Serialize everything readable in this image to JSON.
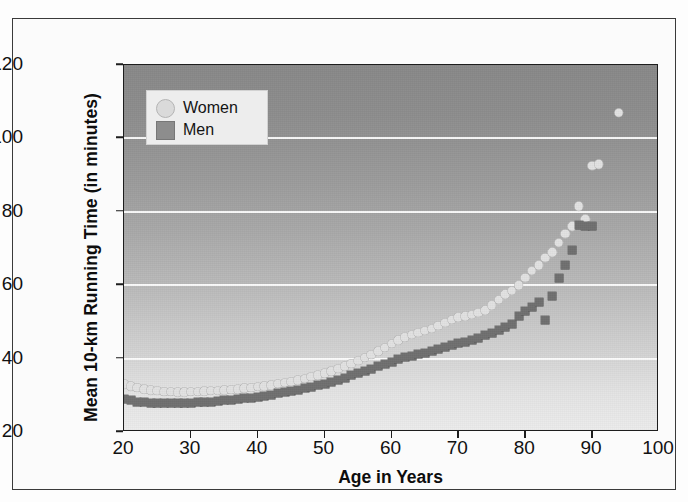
{
  "chart_data": {
    "type": "scatter",
    "title": "",
    "xlabel": "Age in Years",
    "ylabel": "Mean 10-km Running Time (in minutes)",
    "xlim": [
      20,
      100
    ],
    "ylim": [
      20,
      120
    ],
    "xticks": [
      20,
      30,
      40,
      50,
      60,
      70,
      80,
      90,
      100
    ],
    "yticks": [
      20,
      40,
      60,
      80,
      100,
      120
    ],
    "grid": "horizontal-white-gridlines-at-40-60-80-100",
    "legend_position": "top-left-inside-plot",
    "background": "vertical gray gradient, dark at top, light at bottom",
    "series": [
      {
        "name": "Women",
        "marker": "circle",
        "color": "#e2e2e2",
        "points": [
          [
            20,
            33.0
          ],
          [
            21,
            32.4
          ],
          [
            22,
            32.0
          ],
          [
            23,
            31.6
          ],
          [
            24,
            31.4
          ],
          [
            25,
            31.2
          ],
          [
            26,
            31.0
          ],
          [
            27,
            30.9
          ],
          [
            28,
            30.8
          ],
          [
            29,
            30.8
          ],
          [
            30,
            30.9
          ],
          [
            31,
            31.0
          ],
          [
            32,
            31.1
          ],
          [
            33,
            31.2
          ],
          [
            34,
            31.3
          ],
          [
            35,
            31.4
          ],
          [
            36,
            31.5
          ],
          [
            37,
            31.7
          ],
          [
            38,
            31.9
          ],
          [
            39,
            32.1
          ],
          [
            40,
            32.3
          ],
          [
            41,
            32.5
          ],
          [
            42,
            32.8
          ],
          [
            43,
            33.1
          ],
          [
            44,
            33.4
          ],
          [
            45,
            33.7
          ],
          [
            46,
            34.1
          ],
          [
            47,
            34.5
          ],
          [
            48,
            35.0
          ],
          [
            49,
            35.5
          ],
          [
            50,
            36.0
          ],
          [
            51,
            36.6
          ],
          [
            52,
            37.2
          ],
          [
            53,
            37.9
          ],
          [
            54,
            38.6
          ],
          [
            55,
            39.4
          ],
          [
            56,
            40.2
          ],
          [
            57,
            41.1
          ],
          [
            58,
            42.0
          ],
          [
            59,
            43.0
          ],
          [
            60,
            44.0
          ],
          [
            61,
            45.0
          ],
          [
            62,
            45.8
          ],
          [
            63,
            46.5
          ],
          [
            64,
            47.0
          ],
          [
            65,
            47.6
          ],
          [
            66,
            48.2
          ],
          [
            67,
            49.0
          ],
          [
            68,
            49.8
          ],
          [
            69,
            50.6
          ],
          [
            70,
            51.2
          ],
          [
            71,
            51.6
          ],
          [
            72,
            52.0
          ],
          [
            73,
            52.5
          ],
          [
            74,
            53.2
          ],
          [
            75,
            54.5
          ],
          [
            76,
            56.0
          ],
          [
            77,
            57.5
          ],
          [
            78,
            58.5
          ],
          [
            79,
            60.0
          ],
          [
            80,
            62.0
          ],
          [
            81,
            64.0
          ],
          [
            82,
            65.5
          ],
          [
            83,
            67.5
          ],
          [
            84,
            69.0
          ],
          [
            85,
            71.5
          ],
          [
            86,
            74.0
          ],
          [
            87,
            76.0
          ],
          [
            88,
            81.5
          ],
          [
            89,
            78.0
          ],
          [
            90,
            92.5
          ],
          [
            91,
            93.0
          ],
          [
            94,
            107.0
          ]
        ]
      },
      {
        "name": "Men",
        "marker": "square",
        "color": "#707070",
        "points": [
          [
            20,
            29.0
          ],
          [
            21,
            28.6
          ],
          [
            22,
            28.3
          ],
          [
            23,
            28.1
          ],
          [
            24,
            28.0
          ],
          [
            25,
            27.9
          ],
          [
            26,
            27.8
          ],
          [
            27,
            27.8
          ],
          [
            28,
            27.8
          ],
          [
            29,
            27.9
          ],
          [
            30,
            28.0
          ],
          [
            31,
            28.1
          ],
          [
            32,
            28.2
          ],
          [
            33,
            28.3
          ],
          [
            34,
            28.4
          ],
          [
            35,
            28.6
          ],
          [
            36,
            28.8
          ],
          [
            37,
            29.0
          ],
          [
            38,
            29.2
          ],
          [
            39,
            29.4
          ],
          [
            40,
            29.6
          ],
          [
            41,
            29.9
          ],
          [
            42,
            30.2
          ],
          [
            43,
            30.5
          ],
          [
            44,
            30.8
          ],
          [
            45,
            31.1
          ],
          [
            46,
            31.5
          ],
          [
            47,
            31.9
          ],
          [
            48,
            32.3
          ],
          [
            49,
            32.7
          ],
          [
            50,
            33.2
          ],
          [
            51,
            33.7
          ],
          [
            52,
            34.2
          ],
          [
            53,
            34.8
          ],
          [
            54,
            35.4
          ],
          [
            55,
            36.0
          ],
          [
            56,
            36.6
          ],
          [
            57,
            37.2
          ],
          [
            58,
            37.9
          ],
          [
            59,
            38.6
          ],
          [
            60,
            39.2
          ],
          [
            61,
            39.8
          ],
          [
            62,
            40.3
          ],
          [
            63,
            40.8
          ],
          [
            64,
            41.2
          ],
          [
            65,
            41.5
          ],
          [
            66,
            42.0
          ],
          [
            67,
            42.6
          ],
          [
            68,
            43.2
          ],
          [
            69,
            43.8
          ],
          [
            70,
            44.2
          ],
          [
            71,
            44.6
          ],
          [
            72,
            45.0
          ],
          [
            73,
            45.6
          ],
          [
            74,
            46.3
          ],
          [
            75,
            47.0
          ],
          [
            76,
            47.8
          ],
          [
            77,
            48.6
          ],
          [
            78,
            49.5
          ],
          [
            79,
            51.5
          ],
          [
            80,
            53.0
          ],
          [
            81,
            54.0
          ],
          [
            82,
            55.5
          ],
          [
            83,
            50.5
          ],
          [
            84,
            57.0
          ],
          [
            85,
            62.0
          ],
          [
            86,
            65.5
          ],
          [
            87,
            69.5
          ],
          [
            88,
            76.5
          ],
          [
            89,
            76.0
          ],
          [
            90,
            76.0
          ]
        ]
      }
    ]
  },
  "legend": {
    "items": [
      {
        "label": "Women",
        "marker": "circle"
      },
      {
        "label": "Men",
        "marker": "square"
      }
    ]
  }
}
